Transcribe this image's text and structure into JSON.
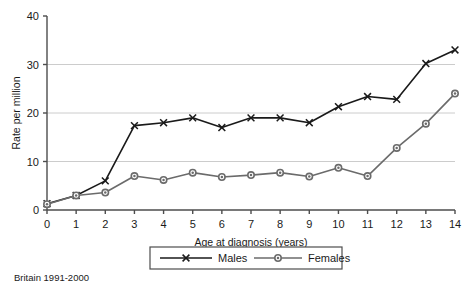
{
  "caption": "Britain 1991-2000",
  "legend": {
    "males_label": "Males",
    "females_label": "Females"
  },
  "colors": {
    "males": "#1a1a1a",
    "females": "#6b6b6b",
    "grid": "#cccccc",
    "axis": "#4d4d4d",
    "text": "#1a1a1a",
    "background": "#ffffff"
  },
  "chart_data": {
    "type": "line",
    "title": "",
    "xlabel": "Age at diagnosis (years)",
    "ylabel": "Rate per million",
    "x": [
      0,
      1,
      2,
      3,
      4,
      5,
      6,
      7,
      8,
      9,
      10,
      11,
      12,
      13,
      14
    ],
    "xticklabels": [
      "0",
      "1",
      "2",
      "3",
      "4",
      "5",
      "6",
      "7",
      "8",
      "9",
      "10",
      "11",
      "12",
      "13",
      "14"
    ],
    "yticklabels": [
      "0",
      "10",
      "20",
      "30",
      "40"
    ],
    "yticks": [
      0,
      10,
      20,
      30,
      40
    ],
    "xlim": [
      0,
      14
    ],
    "ylim": [
      0,
      40
    ],
    "grid": "horizontal",
    "legend_position": "bottom",
    "series": [
      {
        "name": "Males",
        "marker": "x",
        "color": "#1a1a1a",
        "values": [
          1.3,
          3.0,
          6.0,
          17.4,
          18.0,
          19.0,
          17.0,
          19.0,
          19.0,
          18.0,
          21.3,
          23.4,
          22.8,
          30.2,
          33.0
        ]
      },
      {
        "name": "Females",
        "marker": "circle",
        "color": "#6b6b6b",
        "values": [
          1.2,
          3.0,
          3.6,
          7.0,
          6.2,
          7.7,
          6.8,
          7.2,
          7.7,
          6.9,
          8.7,
          7.0,
          12.8,
          17.8,
          24.0
        ]
      }
    ]
  }
}
